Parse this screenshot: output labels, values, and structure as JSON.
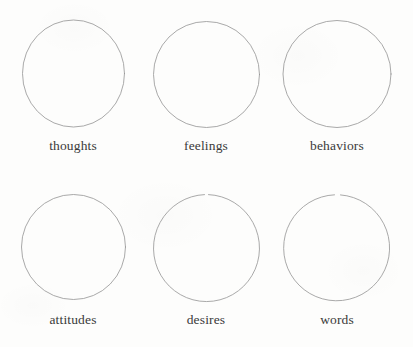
{
  "page": {
    "background_color": "#fdfdfc",
    "stroke_color": "#9a9a99",
    "text_color": "#3a3a3a"
  },
  "diagram": {
    "type": "labeled-circles-grid",
    "columns": 3,
    "rows": 2,
    "circle_shape": "empty-circle-outline",
    "items": [
      {
        "id": "thoughts",
        "label": "thoughts",
        "row": 0,
        "col": 0,
        "circle_gap": "none"
      },
      {
        "id": "feelings",
        "label": "feelings",
        "row": 0,
        "col": 1,
        "circle_gap": "none"
      },
      {
        "id": "behaviors",
        "label": "behaviors",
        "row": 0,
        "col": 2,
        "circle_gap": "none"
      },
      {
        "id": "attitudes",
        "label": "attitudes",
        "row": 1,
        "col": 0,
        "circle_gap": "none"
      },
      {
        "id": "desires",
        "label": "desires",
        "row": 1,
        "col": 1,
        "circle_gap": "top"
      },
      {
        "id": "words",
        "label": "words",
        "row": 1,
        "col": 2,
        "circle_gap": "top"
      }
    ]
  }
}
